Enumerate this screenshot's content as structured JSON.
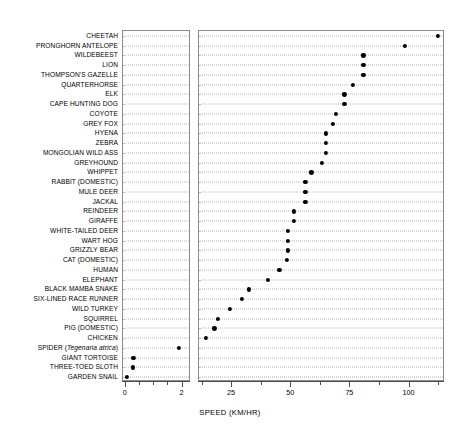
{
  "chart_data": {
    "type": "scatter",
    "title": "",
    "subtitle": "",
    "xlabel": "SPEED (KM/HR)",
    "ylabel": "",
    "grid": true,
    "legend": "none",
    "orientation": "horizontal-dotplot",
    "broken_axis": true,
    "panels": [
      {
        "name": "left-panel",
        "xlim": [
          -0.1,
          2.3
        ],
        "major_ticks": [
          0,
          2
        ],
        "major_tick_labels": [
          "0",
          "2"
        ],
        "minor_ticks": [
          0.5,
          1,
          1.5
        ]
      },
      {
        "name": "right-panel",
        "xlim": [
          11,
          115
        ],
        "major_ticks": [
          25,
          50,
          75,
          100
        ],
        "major_tick_labels": [
          "25",
          "50",
          "75",
          "100"
        ],
        "minor_ticks": [
          12.5,
          37.5,
          62.5,
          87.5,
          112.5
        ]
      }
    ],
    "categories": [
      "CHEETAH",
      "PRONGHORN ANTELOPE",
      "WILDEBEEST",
      "LION",
      "THOMPSON'S GAZELLE",
      "QUARTERHORSE",
      "ELK",
      "CAPE HUNTING DOG",
      "COYOTE",
      "GREY FOX",
      "HYENA",
      "ZEBRA",
      "MONGOLIAN WILD ASS",
      "GREYHOUND",
      "WHIPPET",
      "RABBIT (DOMESTIC)",
      "MULE DEER",
      "JACKAL",
      "REINDEER",
      "GIRAFFE",
      "WHITE-TAILED DEER",
      "WART HOG",
      "GRIZZLY BEAR",
      "CAT (DOMESTIC)",
      "HUMAN",
      "ELEPHANT",
      "BLACK MAMBA SNAKE",
      "SIX-LINED RACE RUNNER",
      "WILD TURKEY",
      "SQUIRREL",
      "PIG (DOMESTIC)",
      "CHICKEN",
      "SPIDER (Tegenaria atrica)",
      "GIANT TORTOISE",
      "THREE-TOED SLOTH",
      "GARDEN SNAIL"
    ],
    "values": [
      112.0,
      98.0,
      80.5,
      80.5,
      80.5,
      76.0,
      72.5,
      72.5,
      69.0,
      67.5,
      64.5,
      64.5,
      64.5,
      63.0,
      58.5,
      56.0,
      56.0,
      56.0,
      51.0,
      51.0,
      48.5,
      48.5,
      48.5,
      48.0,
      45.0,
      40.0,
      32.0,
      29.0,
      24.0,
      19.0,
      17.5,
      14.0,
      1.88,
      0.27,
      0.24,
      0.05
    ],
    "value_panel": [
      "right",
      "right",
      "right",
      "right",
      "right",
      "right",
      "right",
      "right",
      "right",
      "right",
      "right",
      "right",
      "right",
      "right",
      "right",
      "right",
      "right",
      "right",
      "right",
      "right",
      "right",
      "right",
      "right",
      "right",
      "right",
      "right",
      "right",
      "right",
      "right",
      "right",
      "right",
      "right",
      "left",
      "left",
      "left",
      "left"
    ],
    "units": "km/hr",
    "point_color": "#000000",
    "grid_color": "#b8b8b8",
    "frame_color": "#8c8c8c"
  }
}
